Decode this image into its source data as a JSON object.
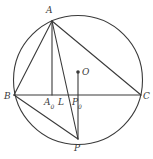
{
  "figure": {
    "background": "#ffffff",
    "stroke_color": "#3a3a3a",
    "label_color": "#3a3a3a",
    "width": 153,
    "height": 159
  },
  "circle": {
    "name": "circumcircle",
    "cx": 78,
    "cy": 80,
    "r": 64.5
  },
  "points": [
    {
      "id": "A",
      "label": "A",
      "sub": "",
      "x": 52,
      "y": 21,
      "label_x": 46,
      "label_y": 6,
      "dot": false
    },
    {
      "id": "B",
      "label": "B",
      "sub": "",
      "x": 14,
      "y": 95,
      "label_x": 4,
      "label_y": 92,
      "dot": false
    },
    {
      "id": "C",
      "label": "C",
      "sub": "",
      "x": 141,
      "y": 95,
      "label_x": 143,
      "label_y": 92,
      "dot": false
    },
    {
      "id": "P",
      "label": "P",
      "sub": "",
      "x": 78,
      "y": 139,
      "label_x": 74,
      "label_y": 144,
      "dot": false
    },
    {
      "id": "O",
      "label": "O",
      "sub": "",
      "x": 78,
      "y": 72,
      "label_x": 82,
      "label_y": 68,
      "dot": true
    },
    {
      "id": "A0",
      "label": "A",
      "sub": "0",
      "x": 52,
      "y": 95,
      "label_x": 44,
      "label_y": 98,
      "dot": false
    },
    {
      "id": "L",
      "label": "L",
      "sub": "",
      "x": 62,
      "y": 95,
      "label_x": 58,
      "label_y": 98,
      "dot": false
    },
    {
      "id": "P0",
      "label": "P",
      "sub": "0",
      "x": 78,
      "y": 95,
      "label_x": 72,
      "label_y": 98,
      "dot": false
    }
  ],
  "segments": [
    {
      "name": "segment-AB",
      "x1": 52,
      "y1": 21,
      "x2": 14,
      "y2": 95
    },
    {
      "name": "segment-AC",
      "x1": 52,
      "y1": 21,
      "x2": 141,
      "y2": 95
    },
    {
      "name": "segment-AP",
      "x1": 52,
      "y1": 21,
      "x2": 78,
      "y2": 139
    },
    {
      "name": "segment-AA0",
      "x1": 52,
      "y1": 21,
      "x2": 52,
      "y2": 95
    },
    {
      "name": "segment-BC",
      "x1": 14,
      "y1": 95,
      "x2": 141,
      "y2": 95
    },
    {
      "name": "segment-BP",
      "x1": 14,
      "y1": 95,
      "x2": 78,
      "y2": 139
    },
    {
      "name": "segment-OP",
      "x1": 78,
      "y1": 72,
      "x2": 78,
      "y2": 139
    }
  ]
}
